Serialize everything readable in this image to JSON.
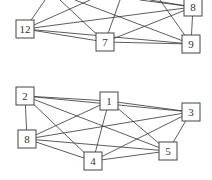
{
  "graphs": [
    {
      "name": "top-graph",
      "nodes": [
        {
          "id": "12",
          "label": "12",
          "x": 25,
          "y": 29
        },
        {
          "id": "7",
          "label": "7",
          "x": 105,
          "y": 42
        },
        {
          "id": "8",
          "label": "8",
          "x": 193,
          "y": 7
        },
        {
          "id": "9",
          "label": "9",
          "x": 191,
          "y": 44
        }
      ],
      "edges": [
        [
          "12",
          "7"
        ],
        [
          "12",
          "9"
        ],
        [
          "12",
          "8"
        ],
        [
          "7",
          "9"
        ],
        [
          "7",
          "8"
        ],
        [
          "8",
          "9"
        ]
      ]
    },
    {
      "name": "bottom-graph",
      "nodes": [
        {
          "id": "2",
          "label": "2",
          "x": 25,
          "y": 96
        },
        {
          "id": "1",
          "label": "1",
          "x": 109,
          "y": 101
        },
        {
          "id": "3",
          "label": "3",
          "x": 191,
          "y": 112
        },
        {
          "id": "8",
          "label": "8",
          "x": 27,
          "y": 139
        },
        {
          "id": "4",
          "label": "4",
          "x": 93,
          "y": 161
        },
        {
          "id": "5",
          "label": "5",
          "x": 168,
          "y": 151
        }
      ],
      "edges": [
        [
          "2",
          "1"
        ],
        [
          "2",
          "3"
        ],
        [
          "2",
          "5"
        ],
        [
          "2",
          "4"
        ],
        [
          "2",
          "8"
        ],
        [
          "1",
          "3"
        ],
        [
          "1",
          "8"
        ],
        [
          "1",
          "4"
        ],
        [
          "1",
          "5"
        ],
        [
          "8",
          "3"
        ],
        [
          "8",
          "5"
        ],
        [
          "8",
          "4"
        ],
        [
          "4",
          "3"
        ],
        [
          "4",
          "5"
        ],
        [
          "3",
          "5"
        ]
      ]
    }
  ]
}
